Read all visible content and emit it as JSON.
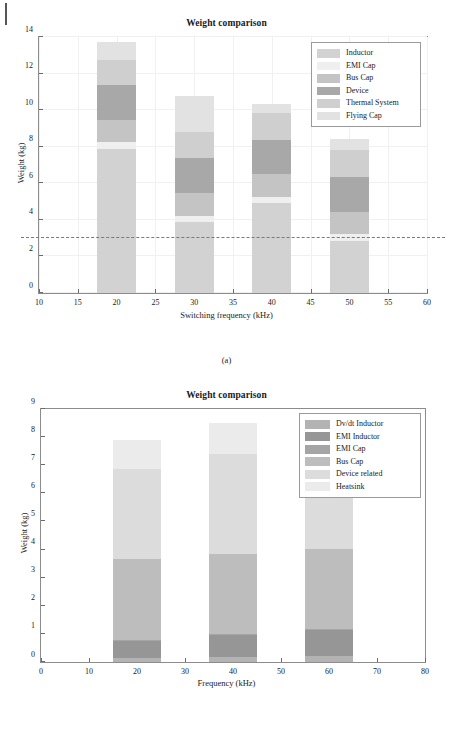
{
  "page": {
    "margin_mark": "page-edge-mark",
    "captions": {
      "a": "(a)",
      "b": "(b)"
    }
  },
  "chart_data": [
    {
      "id": "a",
      "type": "bar",
      "stacked": true,
      "title": "Weight comparison",
      "xlabel": "Switching frequency (kHz)",
      "ylabel": "Weight (kg)",
      "xlim": [
        10,
        60
      ],
      "ylim": [
        0,
        14
      ],
      "xticks": [
        10,
        15,
        20,
        25,
        30,
        35,
        40,
        45,
        50,
        55,
        60
      ],
      "yticks": [
        0,
        2,
        4,
        6,
        8,
        10,
        12,
        14
      ],
      "grid": true,
      "legend_position": "top-right",
      "bar_width": 5,
      "categories": [
        20,
        30,
        40,
        50
      ],
      "annotations": [
        {
          "kind": "dashed-horizontal-line",
          "y": 3.0
        }
      ],
      "series": [
        {
          "name": "Inductor",
          "color": "#d2d2d2",
          "values": [
            7.85,
            3.88,
            4.92,
            2.82
          ]
        },
        {
          "name": "EMI Cap",
          "color": "#efefef",
          "values": [
            0.4,
            0.32,
            0.33,
            0.4
          ]
        },
        {
          "name": "Bus Cap",
          "color": "#c4c4c4",
          "values": [
            1.22,
            1.25,
            1.28,
            1.22
          ]
        },
        {
          "name": "Device",
          "color": "#a8a8a8",
          "values": [
            1.92,
            1.95,
            1.82,
            1.88
          ]
        },
        {
          "name": "Thermal System",
          "color": "#cfcfcf",
          "values": [
            1.35,
            1.4,
            1.48,
            1.48
          ]
        },
        {
          "name": "Flying Cap",
          "color": "#e2e2e2",
          "values": [
            0.99,
            1.95,
            0.53,
            0.65
          ]
        }
      ],
      "totals": [
        13.73,
        10.75,
        10.36,
        8.45
      ]
    },
    {
      "id": "b",
      "type": "bar",
      "stacked": true,
      "title": "Weight comparison",
      "xlabel": "Frequency (kHz)",
      "ylabel": "Weight (kg)",
      "xlim": [
        0,
        80
      ],
      "ylim": [
        0,
        9
      ],
      "xticks": [
        0,
        10,
        20,
        30,
        40,
        50,
        60,
        70,
        80
      ],
      "yticks": [
        0,
        1,
        2,
        3,
        4,
        5,
        6,
        7,
        8,
        9
      ],
      "grid": false,
      "legend_position": "top-right",
      "bar_width": 10,
      "categories": [
        20,
        40,
        60
      ],
      "series": [
        {
          "name": "Dv/dt Inductor",
          "color": "#b3b3b3",
          "values": [
            0.16,
            0.18,
            0.22
          ]
        },
        {
          "name": "EMI Inductor",
          "color": "#969696",
          "values": [
            0.62,
            0.8,
            0.92
          ]
        },
        {
          "name": "EMI Cap",
          "color": "#a5a5a5",
          "values": [
            0.02,
            0.02,
            0.02
          ]
        },
        {
          "name": "Bus Cap",
          "color": "#bdbdbd",
          "values": [
            2.85,
            2.85,
            2.85
          ]
        },
        {
          "name": "Device related",
          "color": "#dcdcdc",
          "values": [
            3.2,
            3.55,
            3.55
          ]
        },
        {
          "name": "Heatsink",
          "color": "#ebebeb",
          "values": [
            1.05,
            1.1,
            1.12
          ]
        }
      ],
      "totals": [
        7.9,
        8.5,
        8.68
      ]
    }
  ]
}
